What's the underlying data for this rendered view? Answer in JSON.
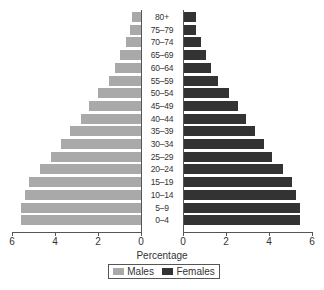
{
  "chart_data": {
    "type": "bar",
    "subtype": "population-pyramid",
    "title": "",
    "xlabel": "Percentage",
    "ylabel": "",
    "categories": [
      "80+",
      "75–79",
      "70–74",
      "65–69",
      "60–64",
      "55–59",
      "50–54",
      "45–49",
      "40–44",
      "35–39",
      "30–34",
      "25–29",
      "20–24",
      "15–19",
      "10–14",
      "5–9",
      "0–4"
    ],
    "series": [
      {
        "name": "Males",
        "color": "#a9a9a9",
        "side": "left",
        "values": [
          0.4,
          0.5,
          0.7,
          1.0,
          1.2,
          1.5,
          2.0,
          2.4,
          2.8,
          3.3,
          3.7,
          4.2,
          4.7,
          5.2,
          5.4,
          5.6,
          5.6
        ]
      },
      {
        "name": "Females",
        "color": "#333333",
        "side": "right",
        "values": [
          0.55,
          0.55,
          0.8,
          1.0,
          1.25,
          1.6,
          2.1,
          2.5,
          2.9,
          3.3,
          3.7,
          4.1,
          4.6,
          5.0,
          5.2,
          5.4,
          5.4
        ]
      }
    ],
    "left_axis": {
      "ticks": [
        "6",
        "4",
        "2",
        "0"
      ],
      "range": [
        6,
        0
      ]
    },
    "right_axis": {
      "ticks": [
        "0",
        "2",
        "4",
        "6"
      ],
      "range": [
        0,
        6
      ]
    },
    "grid": false,
    "legend_position": "bottom"
  },
  "axis": {
    "xlabel": "Percentage",
    "left_ticks": [
      "6",
      "4",
      "2",
      "0"
    ],
    "right_ticks": [
      "0",
      "2",
      "4",
      "6"
    ]
  },
  "legend": {
    "males_label": "Males",
    "females_label": "Females"
  }
}
